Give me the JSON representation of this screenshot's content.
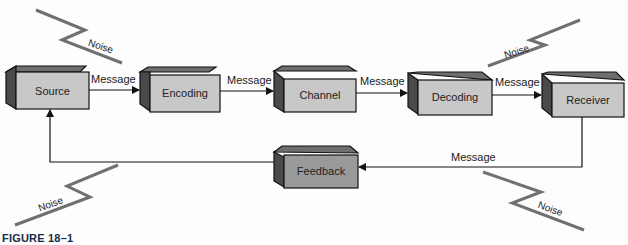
{
  "diagram": {
    "boxes": [
      {
        "id": "source",
        "label": "Source"
      },
      {
        "id": "encoding",
        "label": "Encoding"
      },
      {
        "id": "channel",
        "label": "Channel"
      },
      {
        "id": "decoding",
        "label": "Decoding"
      },
      {
        "id": "receiver",
        "label": "Receiver"
      },
      {
        "id": "feedback",
        "label": "Feedback"
      }
    ],
    "edges": [
      {
        "from": "source",
        "to": "encoding",
        "label": "Message"
      },
      {
        "from": "encoding",
        "to": "channel",
        "label": "Message"
      },
      {
        "from": "channel",
        "to": "decoding",
        "label": "Message"
      },
      {
        "from": "decoding",
        "to": "receiver",
        "label": "Message"
      },
      {
        "from": "receiver",
        "to": "feedback",
        "label": "Message"
      },
      {
        "from": "feedback",
        "to": "source",
        "label": ""
      }
    ],
    "noise_labels": [
      "Noise",
      "Noise",
      "Noise",
      "Noise"
    ],
    "caption": "FIGURE 18–1"
  },
  "colors": {
    "box_front": "#c8c8c8",
    "box_top": "#6e6e6e",
    "box_side": "#4a4a4a",
    "feedback_front": "#9a9a9a",
    "noise_line": "#707070",
    "caption": "#1a2a4a"
  }
}
